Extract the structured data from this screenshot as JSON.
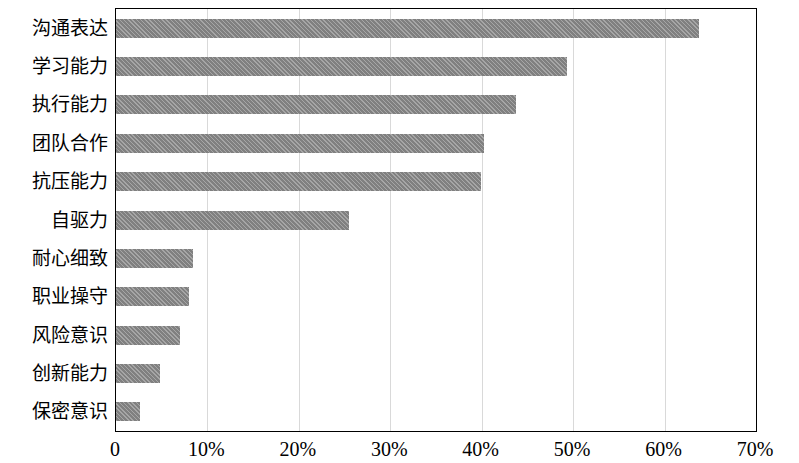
{
  "chart_data": {
    "type": "bar",
    "orientation": "horizontal",
    "title": "",
    "xlabel": "",
    "ylabel": "",
    "xlim": [
      0,
      70
    ],
    "xticks": [
      0,
      10,
      20,
      30,
      40,
      50,
      60,
      70
    ],
    "xtick_labels": [
      "0",
      "10%",
      "20%",
      "30%",
      "40%",
      "50%",
      "60%",
      "70%"
    ],
    "grid": "vertical",
    "legend": "none",
    "bar_color": "#808080",
    "categories": [
      "沟通表达",
      "学习能力",
      "执行能力",
      "团队合作",
      "抗压能力",
      "自驱力",
      "耐心细致",
      "职业操守",
      "风险意识",
      "创新能力",
      "保密意识"
    ],
    "values": [
      63.8,
      49.3,
      43.8,
      40.3,
      39.9,
      25.5,
      8.4,
      8.0,
      7.0,
      4.8,
      2.6
    ]
  }
}
